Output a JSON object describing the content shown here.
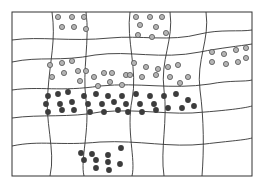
{
  "diagram": {
    "frame": {
      "x": 12,
      "y": 12,
      "width": 240,
      "height": 164
    },
    "colors": {
      "light_dot_fill": "#b4b4b4",
      "light_dot_stroke": "#555555",
      "dark_dot": "#3c3c3c",
      "line": "#333333"
    },
    "horizontal_lines": [
      "M12,40 C40,36 70,42 110,38 C140,35 170,42 200,34 C220,29 240,32 252,30",
      "M12,62 C40,56 60,62 95,55 C130,50 160,60 200,52 C220,48 240,46 252,44",
      "M12,90 C40,86 60,92 100,86 C140,82 170,90 210,84 C230,80 245,82 252,80",
      "M12,118 C40,114 70,118 100,112 C140,108 170,116 205,112 C230,110 245,108 252,106",
      "M12,146 C40,140 60,146 100,142 C140,140 170,148 205,144 C230,141 245,140 252,138"
    ],
    "vertical_lines": [
      "M52,12 C56,40 50,60 48,90 C44,120 56,150 50,176",
      "M86,12 C90,40 82,70 86,100 C90,130 80,160 84,176",
      "M130,12 C126,40 138,70 132,100 C126,130 136,160 132,176",
      "M170,12 C174,40 160,60 164,90 C168,120 160,150 164,176",
      "M206,12 C210,40 196,60 200,90 C204,120 204,150 202,176"
    ],
    "light_dots": [
      [
        58,
        17
      ],
      [
        72,
        17
      ],
      [
        84,
        17
      ],
      [
        62,
        27
      ],
      [
        74,
        27
      ],
      [
        86,
        29
      ],
      [
        136,
        17
      ],
      [
        150,
        17
      ],
      [
        162,
        17
      ],
      [
        140,
        25
      ],
      [
        156,
        27
      ],
      [
        138,
        35
      ],
      [
        152,
        37
      ],
      [
        166,
        33
      ],
      [
        212,
        52
      ],
      [
        224,
        54
      ],
      [
        236,
        50
      ],
      [
        246,
        48
      ],
      [
        212,
        62
      ],
      [
        226,
        64
      ],
      [
        238,
        62
      ],
      [
        246,
        58
      ],
      [
        50,
        65
      ],
      [
        62,
        63
      ],
      [
        72,
        61
      ],
      [
        52,
        77
      ],
      [
        64,
        73
      ],
      [
        78,
        71
      ],
      [
        80,
        81
      ],
      [
        86,
        71
      ],
      [
        94,
        77
      ],
      [
        104,
        73
      ],
      [
        112,
        73
      ],
      [
        98,
        86
      ],
      [
        110,
        82
      ],
      [
        122,
        85
      ],
      [
        126,
        75
      ],
      [
        134,
        63
      ],
      [
        146,
        67
      ],
      [
        158,
        69
      ],
      [
        168,
        67
      ],
      [
        178,
        65
      ],
      [
        130,
        75
      ],
      [
        142,
        77
      ],
      [
        156,
        75
      ],
      [
        170,
        77
      ],
      [
        180,
        83
      ],
      [
        188,
        77
      ]
    ],
    "dark_dots": [
      [
        48,
        96
      ],
      [
        58,
        94
      ],
      [
        68,
        92
      ],
      [
        46,
        104
      ],
      [
        60,
        104
      ],
      [
        72,
        102
      ],
      [
        48,
        112
      ],
      [
        62,
        110
      ],
      [
        74,
        110
      ],
      [
        84,
        96
      ],
      [
        96,
        94
      ],
      [
        108,
        96
      ],
      [
        88,
        104
      ],
      [
        102,
        104
      ],
      [
        114,
        102
      ],
      [
        90,
        112
      ],
      [
        104,
        112
      ],
      [
        118,
        110
      ],
      [
        122,
        96
      ],
      [
        136,
        94
      ],
      [
        150,
        96
      ],
      [
        126,
        104
      ],
      [
        140,
        104
      ],
      [
        154,
        104
      ],
      [
        128,
        112
      ],
      [
        142,
        112
      ],
      [
        156,
        110
      ],
      [
        164,
        96
      ],
      [
        176,
        94
      ],
      [
        188,
        100
      ],
      [
        168,
        108
      ],
      [
        182,
        108
      ],
      [
        194,
        106
      ],
      [
        81,
        153
      ],
      [
        92,
        154
      ],
      [
        108,
        155
      ],
      [
        84,
        160
      ],
      [
        96,
        160
      ],
      [
        108,
        162
      ],
      [
        121,
        148
      ],
      [
        120,
        164
      ],
      [
        96,
        168
      ],
      [
        109,
        170
      ]
    ]
  }
}
